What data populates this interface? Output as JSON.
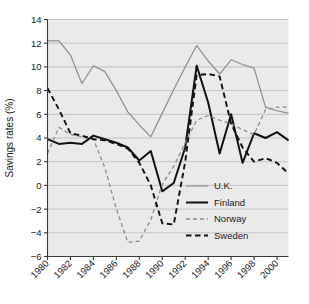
{
  "chart_data": {
    "type": "line",
    "title": "",
    "xlabel": "",
    "ylabel": "Savings rates (%)",
    "xlim": [
      1980,
      2001
    ],
    "ylim": [
      -6,
      14
    ],
    "xticks": [
      1980,
      1982,
      1984,
      1986,
      1988,
      1990,
      1992,
      1994,
      1996,
      1998,
      2000
    ],
    "yticks": [
      -6,
      -4,
      -2,
      0,
      2,
      4,
      6,
      8,
      10,
      12,
      14
    ],
    "grid": true,
    "legend_position": "center-right-inside",
    "x": [
      1980,
      1981,
      1982,
      1983,
      1984,
      1985,
      1986,
      1987,
      1988,
      1989,
      1990,
      1991,
      1992,
      1993,
      1994,
      1995,
      1996,
      1997,
      1998,
      1999,
      2000,
      2001
    ],
    "series": [
      {
        "name": "U.K.",
        "color": "#8c8c8c",
        "style": "solid",
        "width": 1.2,
        "values": [
          12.2,
          12.2,
          11.0,
          8.6,
          10.1,
          9.6,
          8.0,
          6.2,
          5.1,
          4.1,
          6.1,
          8.1,
          10.0,
          11.8,
          10.5,
          9.4,
          10.6,
          10.2,
          9.9,
          6.6,
          6.3,
          6.1
        ]
      },
      {
        "name": "Finland",
        "color": "#111111",
        "style": "solid",
        "width": 2.0,
        "values": [
          3.9,
          3.5,
          3.6,
          3.5,
          4.2,
          3.9,
          3.6,
          3.2,
          2.1,
          2.9,
          -0.5,
          0.2,
          3.2,
          10.1,
          7.0,
          2.7,
          6.0,
          1.9,
          4.4,
          4.0,
          4.5,
          3.8
        ]
      },
      {
        "name": "Norway",
        "color": "#8c8c8c",
        "style": "dashed-fine",
        "width": 1.3,
        "values": [
          2.7,
          4.9,
          4.3,
          4.1,
          3.9,
          1.5,
          -2.0,
          -4.8,
          -4.7,
          -2.9,
          0.1,
          1.6,
          3.6,
          5.5,
          5.9,
          5.5,
          5.2,
          4.7,
          4.3,
          6.4,
          6.6,
          6.6
        ]
      },
      {
        "name": "Sweden",
        "color": "#111111",
        "style": "dashed-bold",
        "width": 1.9,
        "values": [
          8.2,
          6.4,
          4.4,
          4.2,
          3.9,
          3.8,
          3.5,
          3.1,
          1.9,
          0.0,
          -3.2,
          -3.3,
          2.0,
          9.3,
          9.4,
          9.2,
          5.2,
          3.2,
          2.0,
          2.3,
          1.9,
          1.0
        ]
      }
    ]
  },
  "legend": {
    "entries": [
      {
        "label": "U.K."
      },
      {
        "label": "Finland"
      },
      {
        "label": "Norway"
      },
      {
        "label": "Sweden"
      }
    ]
  },
  "axes": {
    "y_title": "Savings rates (%)",
    "y_tick_labels": [
      "14",
      "12",
      "10",
      "8",
      "6",
      "4",
      "2",
      "0",
      "−2",
      "−4",
      "−6"
    ],
    "x_tick_labels": [
      "1980",
      "1982",
      "1984",
      "1986",
      "1988",
      "1990",
      "1992",
      "1994",
      "1996",
      "1998",
      "2000"
    ]
  }
}
